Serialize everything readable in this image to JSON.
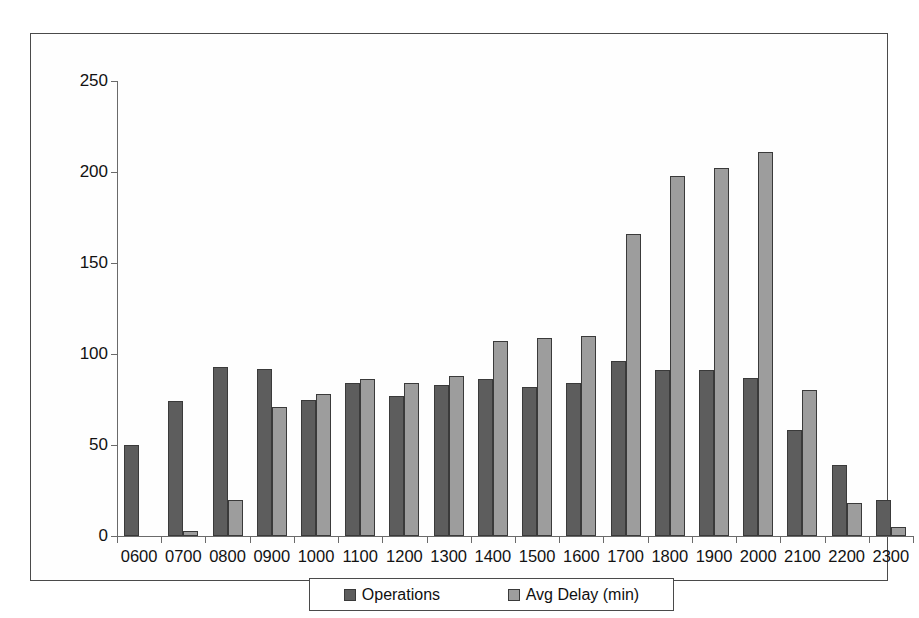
{
  "chart_data": {
    "type": "bar",
    "title": "",
    "xlabel": "",
    "ylabel": "",
    "ylim": [
      0,
      250
    ],
    "yticks": [
      0,
      50,
      100,
      150,
      200,
      250
    ],
    "grid": false,
    "legend_position": "bottom",
    "categories": [
      "0600",
      "0700",
      "0800",
      "0900",
      "1000",
      "1100",
      "1200",
      "1300",
      "1400",
      "1500",
      "1600",
      "1700",
      "1800",
      "1900",
      "2000",
      "2100",
      "2200",
      "2300"
    ],
    "series": [
      {
        "name": "Operations",
        "color": "#5d5d5d",
        "values": [
          50,
          74,
          93,
          92,
          75,
          84,
          77,
          83,
          86,
          82,
          84,
          96,
          91,
          91,
          87,
          58,
          39,
          20
        ]
      },
      {
        "name": "Avg Delay (min)",
        "color": "#9d9d9d",
        "values": [
          0,
          3,
          20,
          71,
          78,
          86,
          84,
          88,
          107,
          109,
          110,
          166,
          198,
          202,
          211,
          80,
          18,
          5
        ]
      }
    ]
  },
  "legend": {
    "entries": [
      {
        "label": "Operations"
      },
      {
        "label": "Avg Delay (min)"
      }
    ]
  }
}
